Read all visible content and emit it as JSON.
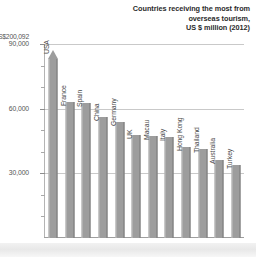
{
  "chart_data": {
    "type": "bar",
    "title": "Countries receiving the most from overseas tourism, US $ million (2012)",
    "title_lines": [
      "Countries receiving the most from",
      "overseas tourism,",
      "US $ million (2012)"
    ],
    "xlabel": "",
    "ylabel": "",
    "ylim": [
      0,
      90000
    ],
    "grid": true,
    "legend": false,
    "categories": [
      "USA",
      "France",
      "Spain",
      "China",
      "Germany",
      "UK",
      "Macau",
      "Italy",
      "Hong Kong",
      "Thailand",
      "Australia",
      "Turkey"
    ],
    "values": [
      200092,
      63000,
      62500,
      56000,
      54000,
      48000,
      47500,
      47000,
      42000,
      41500,
      36000,
      34000
    ],
    "ytick_labels": [
      "90,000",
      "60,000",
      "30,000"
    ],
    "ytick_values": [
      90000,
      60000,
      30000
    ],
    "minor_tick_values": [
      80000,
      70000,
      50000,
      40000,
      20000,
      10000
    ],
    "overflow_label": "US$200,092",
    "overflow_category": "USA"
  },
  "bars": [
    {
      "label": "USA",
      "value": 200092,
      "value_label": "US$200,092",
      "overflow": true
    },
    {
      "label": "France",
      "value": 63000,
      "overflow": false
    },
    {
      "label": "Spain",
      "value": 62500,
      "overflow": false
    },
    {
      "label": "China",
      "value": 56000,
      "overflow": false
    },
    {
      "label": "Germany",
      "value": 54000,
      "overflow": false
    },
    {
      "label": "UK",
      "value": 48000,
      "overflow": false
    },
    {
      "label": "Macau",
      "value": 47500,
      "overflow": false
    },
    {
      "label": "Italy",
      "value": 47000,
      "overflow": false
    },
    {
      "label": "Hong Kong",
      "value": 42000,
      "overflow": false
    },
    {
      "label": "Thailand",
      "value": 41500,
      "overflow": false
    },
    {
      "label": "Australia",
      "value": 36000,
      "overflow": false
    },
    {
      "label": "Turkey",
      "value": 34000,
      "overflow": false
    }
  ],
  "axis": {
    "top_value_label": "US$200,092",
    "ticks": [
      {
        "label": "90,000",
        "value": 90000,
        "major": true
      },
      {
        "label": "",
        "value": 80000,
        "major": false
      },
      {
        "label": "",
        "value": 70000,
        "major": false
      },
      {
        "label": "60,000",
        "value": 60000,
        "major": true
      },
      {
        "label": "",
        "value": 50000,
        "major": false
      },
      {
        "label": "",
        "value": 40000,
        "major": false
      },
      {
        "label": "30,000",
        "value": 30000,
        "major": true
      },
      {
        "label": "",
        "value": 20000,
        "major": false
      },
      {
        "label": "",
        "value": 10000,
        "major": false
      }
    ]
  },
  "colors": {
    "bar_fill": "#9d9d9d",
    "grid": "#c9c9c9",
    "axis": "#9e9e9e",
    "title_text": "#2b2b2b",
    "label_text": "#4a4a4a",
    "background": "#ffffff"
  }
}
